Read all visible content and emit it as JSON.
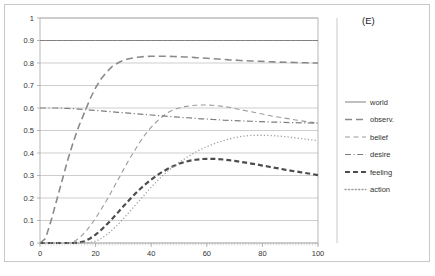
{
  "panel": {
    "label": "(E)"
  },
  "chart_data": {
    "type": "line",
    "title": "",
    "xlabel": "",
    "ylabel": "",
    "xlim": [
      0,
      100
    ],
    "ylim": [
      0,
      1
    ],
    "grid": true,
    "legend_position": "right",
    "xticks": [
      "0",
      "20",
      "40",
      "60",
      "80",
      "100"
    ],
    "xtick_values": [
      0,
      20,
      40,
      60,
      80,
      100
    ],
    "yticks": [
      "0",
      "0.1",
      "0.2",
      "0.3",
      "0.4",
      "0.5",
      "0.6",
      "0.7",
      "0.8",
      "0.9",
      "1"
    ],
    "ytick_values": [
      0,
      0.1,
      0.2,
      0.3,
      0.4,
      0.5,
      0.6,
      0.7,
      0.8,
      0.9,
      1
    ],
    "x": [
      0,
      2,
      4,
      6,
      8,
      10,
      12,
      14,
      16,
      18,
      20,
      22,
      24,
      26,
      28,
      30,
      32,
      34,
      36,
      38,
      40,
      42,
      44,
      46,
      48,
      50,
      52,
      54,
      56,
      58,
      60,
      62,
      64,
      66,
      68,
      70,
      72,
      74,
      76,
      78,
      80,
      82,
      84,
      86,
      88,
      90,
      92,
      94,
      96,
      98,
      100
    ],
    "series": [
      {
        "name": "world",
        "style": "solid",
        "color": "#808080",
        "width": 1.0,
        "values": [
          0.9,
          0.9,
          0.9,
          0.9,
          0.9,
          0.9,
          0.9,
          0.9,
          0.9,
          0.9,
          0.9,
          0.9,
          0.9,
          0.9,
          0.9,
          0.9,
          0.9,
          0.9,
          0.9,
          0.9,
          0.9,
          0.9,
          0.9,
          0.9,
          0.9,
          0.9,
          0.9,
          0.9,
          0.9,
          0.9,
          0.9,
          0.9,
          0.9,
          0.9,
          0.9,
          0.9,
          0.9,
          0.9,
          0.9,
          0.9,
          0.9,
          0.9,
          0.9,
          0.9,
          0.9,
          0.9,
          0.9,
          0.9,
          0.9,
          0.9,
          0.9
        ]
      },
      {
        "name": "observ.",
        "style": "long-dash",
        "color": "#8a8a8a",
        "width": 1.6,
        "values": [
          0.0,
          0.02,
          0.1,
          0.19,
          0.28,
          0.37,
          0.45,
          0.52,
          0.58,
          0.64,
          0.69,
          0.73,
          0.76,
          0.785,
          0.8,
          0.812,
          0.819,
          0.824,
          0.827,
          0.829,
          0.83,
          0.83,
          0.83,
          0.83,
          0.829,
          0.828,
          0.827,
          0.826,
          0.824,
          0.823,
          0.821,
          0.819,
          0.818,
          0.816,
          0.814,
          0.813,
          0.811,
          0.81,
          0.809,
          0.808,
          0.807,
          0.806,
          0.805,
          0.804,
          0.803,
          0.803,
          0.802,
          0.801,
          0.801,
          0.8,
          0.8
        ]
      },
      {
        "name": "belief",
        "style": "dash",
        "color": "#9a9a9a",
        "width": 1.1,
        "values": [
          0.0,
          0.0,
          0.0,
          0.0,
          0.0,
          0.0,
          0.005,
          0.02,
          0.045,
          0.075,
          0.11,
          0.15,
          0.19,
          0.235,
          0.28,
          0.325,
          0.37,
          0.41,
          0.45,
          0.485,
          0.515,
          0.54,
          0.562,
          0.58,
          0.592,
          0.6,
          0.606,
          0.61,
          0.612,
          0.613,
          0.613,
          0.612,
          0.61,
          0.607,
          0.603,
          0.598,
          0.593,
          0.588,
          0.583,
          0.578,
          0.573,
          0.568,
          0.563,
          0.559,
          0.555,
          0.551,
          0.547,
          0.543,
          0.539,
          0.536,
          0.533
        ]
      },
      {
        "name": "desire",
        "style": "dash-dot",
        "color": "#7e7e7e",
        "width": 1.2,
        "values": [
          0.6,
          0.6,
          0.6,
          0.6,
          0.599,
          0.598,
          0.597,
          0.595,
          0.593,
          0.591,
          0.589,
          0.587,
          0.585,
          0.583,
          0.581,
          0.579,
          0.577,
          0.575,
          0.573,
          0.571,
          0.569,
          0.567,
          0.565,
          0.563,
          0.561,
          0.559,
          0.557,
          0.556,
          0.554,
          0.552,
          0.551,
          0.549,
          0.548,
          0.546,
          0.545,
          0.544,
          0.543,
          0.542,
          0.541,
          0.54,
          0.539,
          0.538,
          0.537,
          0.537,
          0.536,
          0.535,
          0.535,
          0.534,
          0.534,
          0.533,
          0.533
        ]
      },
      {
        "name": "feeling",
        "style": "bold-dash",
        "color": "#4d4d4d",
        "width": 2.2,
        "values": [
          0.0,
          0.0,
          0.0,
          0.0,
          0.0,
          0.0,
          0.0,
          0.002,
          0.008,
          0.02,
          0.037,
          0.058,
          0.082,
          0.108,
          0.135,
          0.163,
          0.19,
          0.216,
          0.24,
          0.262,
          0.282,
          0.3,
          0.316,
          0.33,
          0.342,
          0.352,
          0.36,
          0.366,
          0.37,
          0.373,
          0.374,
          0.374,
          0.373,
          0.371,
          0.368,
          0.365,
          0.361,
          0.357,
          0.353,
          0.349,
          0.344,
          0.34,
          0.335,
          0.331,
          0.326,
          0.322,
          0.318,
          0.314,
          0.31,
          0.306,
          0.302
        ]
      },
      {
        "name": "action",
        "style": "dot",
        "color": "#9e9e9e",
        "width": 1.3,
        "values": [
          0.0,
          0.0,
          0.0,
          0.0,
          0.0,
          0.0,
          0.0,
          0.0,
          0.0,
          0.002,
          0.008,
          0.02,
          0.037,
          0.058,
          0.082,
          0.108,
          0.136,
          0.164,
          0.192,
          0.22,
          0.248,
          0.274,
          0.298,
          0.32,
          0.34,
          0.358,
          0.374,
          0.39,
          0.404,
          0.417,
          0.428,
          0.438,
          0.447,
          0.455,
          0.462,
          0.468,
          0.473,
          0.476,
          0.478,
          0.479,
          0.479,
          0.478,
          0.477,
          0.475,
          0.473,
          0.47,
          0.467,
          0.464,
          0.461,
          0.458,
          0.455
        ]
      }
    ]
  },
  "legend": {
    "items": [
      {
        "label": "world",
        "style": "solid"
      },
      {
        "label": "observ.",
        "style": "long-dash"
      },
      {
        "label": "belief",
        "style": "dash"
      },
      {
        "label": "desire",
        "style": "dash-dot"
      },
      {
        "label": "feeling",
        "style": "bold-dash"
      },
      {
        "label": "action",
        "style": "dot"
      }
    ]
  }
}
